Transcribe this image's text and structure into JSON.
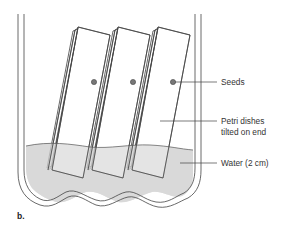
{
  "diagram": {
    "panel_label": "b.",
    "labels": {
      "seeds": "Seeds",
      "petri_line1": "Petri dishes",
      "petri_line2": "tilted on end",
      "water": "Water (2 cm)"
    },
    "colors": {
      "line": "#444444",
      "water": "#d9d9d9",
      "seed": "#777777",
      "background": "#ffffff"
    },
    "dish_count": 3,
    "seed_count": 3
  }
}
